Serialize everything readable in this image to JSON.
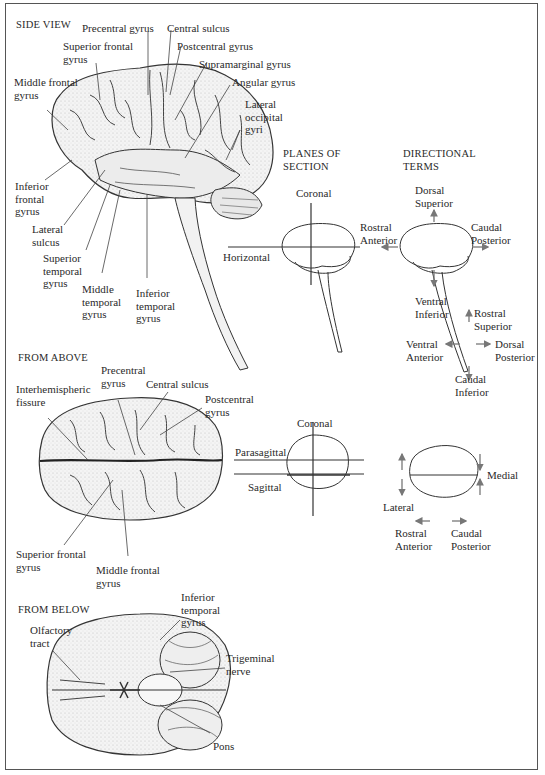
{
  "figure": {
    "sections": {
      "side_view": {
        "heading": "SIDE VIEW",
        "labels": {
          "precentral_gyrus": "Precentral gyrus",
          "central_sulcus": "Central sulcus",
          "superior_frontal_gyrus": "Superior frontal\ngyrus",
          "postcentral_gyrus": "Postcentral gyrus",
          "supramarginal_gyrus": "Supramarginal gyrus",
          "middle_frontal_gyrus": "Middle frontal\ngyrus",
          "angular_gyrus": "Angular gyrus",
          "lateral_occipital_gyri": "Lateral\noccipital\ngyri",
          "inferior_frontal_gyrus": "Inferior\nfrontal\ngyrus",
          "lateral_sulcus": "Lateral\nsulcus",
          "superior_temporal_gyrus": "Superior\ntemporal\ngyrus",
          "middle_temporal_gyrus": "Middle\ntemporal\ngyrus",
          "inferior_temporal_gyrus": "Inferior\ntemporal\ngyrus"
        }
      },
      "planes_of_section_side": {
        "heading": "PLANES OF\nSECTION",
        "labels": {
          "coronal": "Coronal",
          "horizontal": "Horizontal"
        }
      },
      "directional_terms_side": {
        "heading": "DIRECTIONAL\nTERMS",
        "labels": {
          "dorsal_superior": "Dorsal\nSuperior",
          "rostral_anterior": "Rostral\nAnterior",
          "caudal_posterior": "Caudal\nPosterior",
          "ventral_inferior": "Ventral\nInferior",
          "rostral_superior": "Rostral\nSuperior",
          "ventral_anterior": "Ventral\nAnterior",
          "dorsal_posterior": "Dorsal\nPosterior",
          "caudal_inferior": "Caudal\nInferior"
        }
      },
      "from_above": {
        "heading": "FROM ABOVE",
        "labels": {
          "precentral_gyrus": "Precentral\ngyrus",
          "central_sulcus": "Central sulcus",
          "interhemispheric_fissure": "Interhemispheric\nfissure",
          "postcentral_gyrus": "Postcentral\ngyrus",
          "superior_frontal_gyrus": "Superior frontal\ngyrus",
          "middle_frontal_gyrus": "Middle frontal\ngyrus"
        }
      },
      "planes_of_section_above": {
        "labels": {
          "coronal": "Coronal",
          "parasagittal": "Parasagittal",
          "sagittal": "Sagittal"
        }
      },
      "directional_terms_above": {
        "labels": {
          "medial": "Medial",
          "lateral": "Lateral",
          "rostral_anterior": "Rostral\nAnterior",
          "caudal_posterior": "Caudal\nPosterior"
        }
      },
      "from_below": {
        "heading": "FROM BELOW",
        "labels": {
          "inferior_temporal_gyrus": "Inferior\ntemporal\ngyrus",
          "olfactory_tract": "Olfactory\ntract",
          "trigeminal_nerve": "Trigeminal\nnerve",
          "pons": "Pons"
        }
      }
    },
    "colors": {
      "ink": "#2a2a2a",
      "line": "#444444",
      "arrow": "#777777",
      "shade": "#d9d9d9"
    }
  }
}
